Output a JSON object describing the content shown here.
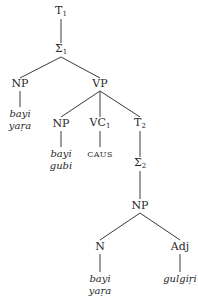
{
  "diagram": {
    "type": "syntax-tree",
    "nodes": {
      "t1": {
        "label": "T",
        "sub": "1"
      },
      "sigma1": {
        "label": "Σ",
        "sub": "1"
      },
      "np_subject": {
        "label": "NP"
      },
      "vp": {
        "label": "VP"
      },
      "np_object": {
        "label": "NP"
      },
      "vc1": {
        "label": "VC",
        "sub": "1"
      },
      "t2": {
        "label": "T",
        "sub": "2"
      },
      "sigma2": {
        "label": "Σ",
        "sub": "2"
      },
      "np_embedded": {
        "label": "NP"
      },
      "n": {
        "label": "N"
      },
      "adj": {
        "label": "Adj"
      }
    },
    "leaves": {
      "np_subject": [
        "bayi",
        "yaṛa"
      ],
      "np_object": [
        "bayi",
        "gubi"
      ],
      "vc1": "CAUS",
      "n": [
        "bayi",
        "yaṛa"
      ],
      "adj": "gulgiṛi"
    },
    "edges": [
      [
        "T1",
        "Σ1"
      ],
      [
        "Σ1",
        "NP"
      ],
      [
        "Σ1",
        "VP"
      ],
      [
        "NP",
        "bayi yaṛa"
      ],
      [
        "VP",
        "NP"
      ],
      [
        "VP",
        "VC1"
      ],
      [
        "VP",
        "T2"
      ],
      [
        "NP",
        "bayi gubi"
      ],
      [
        "VC1",
        "CAUS"
      ],
      [
        "T2",
        "Σ2"
      ],
      [
        "Σ2",
        "NP"
      ],
      [
        "NP",
        "N"
      ],
      [
        "NP",
        "Adj"
      ],
      [
        "N",
        "bayi yaṛa"
      ],
      [
        "Adj",
        "gulgiṛi"
      ]
    ]
  }
}
